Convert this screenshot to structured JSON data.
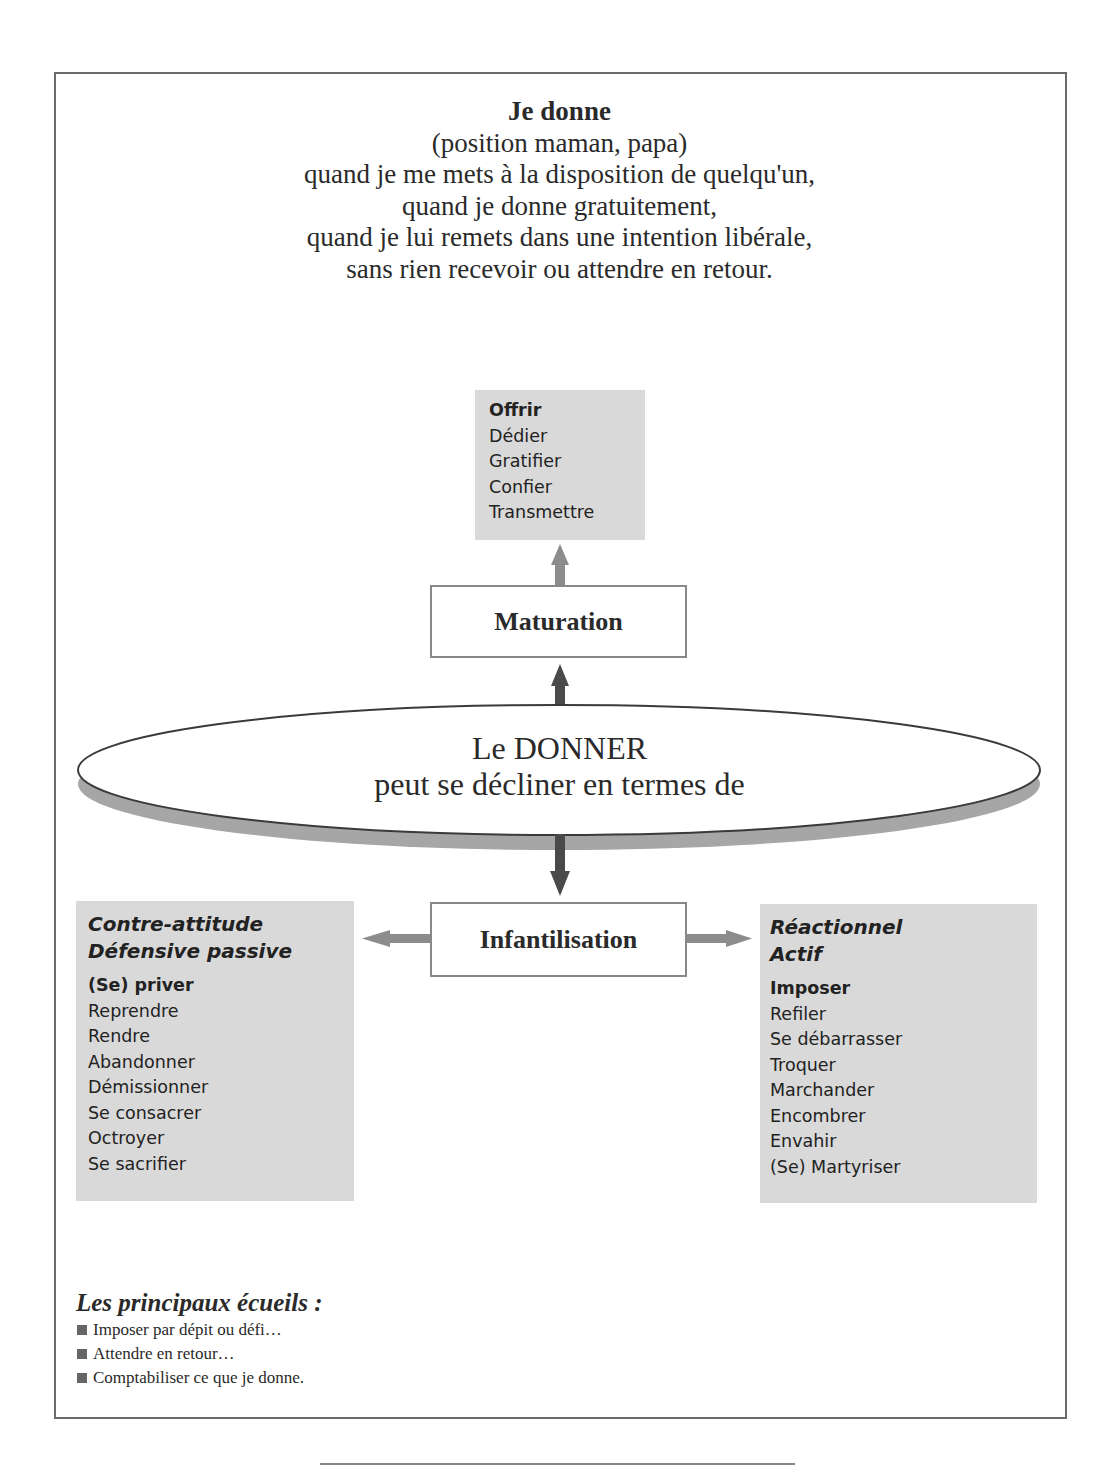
{
  "intro": {
    "title": "Je donne",
    "lines": [
      "(position maman, papa)",
      "quand je me mets à la disposition de quelqu'un,",
      "quand je donne gratuitement,",
      "quand je lui remets dans une intention libérale,",
      "sans rien recevoir ou attendre en retour."
    ]
  },
  "top_box": {
    "items": [
      "Offrir",
      "Dédier",
      "Gratifier",
      "Confier",
      "Transmettre"
    ]
  },
  "maturation_box": {
    "label": "Maturation"
  },
  "ellipse": {
    "line1": "Le DONNER",
    "line2": "peut se décliner en termes de"
  },
  "infantilisation_box": {
    "label": "Infantilisation"
  },
  "left_box": {
    "heading1": "Contre-attitude",
    "heading2": "Défensive passive",
    "items": [
      "(Se) priver",
      "Reprendre",
      "Rendre",
      "Abandonner",
      "Démissionner",
      "Se consacrer",
      "Octroyer",
      "Se sacrifier"
    ]
  },
  "right_box": {
    "heading1": "Réactionnel",
    "heading2": "Actif",
    "items": [
      "Imposer",
      "Refiler",
      "Se débarrasser",
      "Troquer",
      "Marchander",
      "Encombrer",
      "Envahir",
      "(Se) Martyriser"
    ]
  },
  "pitfalls": {
    "title": "Les principaux écueils :",
    "items": [
      "Imposer par dépit ou défi…",
      "Attendre en retour…",
      "Comptabiliser ce que je donne."
    ]
  },
  "colors": {
    "gray_box": "#d9d9d9",
    "arrow_light": "#8c8c8c",
    "arrow_dark": "#4a4a4a",
    "ellipse_shadow": "#a6a6a6",
    "frame": "#6a6a6a"
  }
}
